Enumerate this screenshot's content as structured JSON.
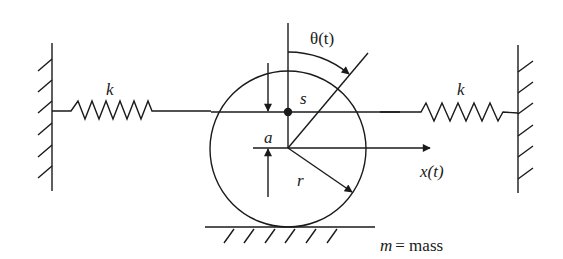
{
  "diagram": {
    "colors": {
      "stroke": "#1a1a1a",
      "background": "#ffffff"
    },
    "labels": {
      "spring_left": "k",
      "spring_right": "k",
      "theta": "θ(t)",
      "s": "s",
      "a": "a",
      "r": "r",
      "x": "x(t)",
      "mass_m": "m",
      "mass_eq": "= mass"
    },
    "components": [
      {
        "id": "left-wall",
        "type": "fixed-wall"
      },
      {
        "id": "left-spring",
        "type": "spring",
        "label": "k"
      },
      {
        "id": "disk",
        "type": "circle",
        "radius_label": "r"
      },
      {
        "id": "point-mass",
        "type": "dot",
        "offset_label": "a"
      },
      {
        "id": "right-spring",
        "type": "spring",
        "label": "k"
      },
      {
        "id": "right-wall",
        "type": "fixed-wall"
      },
      {
        "id": "ground",
        "type": "fixed-ground"
      }
    ]
  }
}
